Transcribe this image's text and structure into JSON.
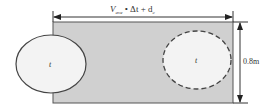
{
  "diagram": {
    "top_dimension": {
      "label_main": "V",
      "label_sub": "ave",
      "label_rest": " • Δt + d",
      "label_sub2": "c"
    },
    "right_dimension": {
      "label": "0.8m"
    },
    "left_ellipse": {
      "label": "t",
      "style": "solid"
    },
    "right_ellipse": {
      "label": "t",
      "style": "dashed"
    },
    "colors": {
      "region_fill": "#d0d0d0",
      "ellipse_fill": "#f3f3f3",
      "stroke": "#444444"
    }
  }
}
